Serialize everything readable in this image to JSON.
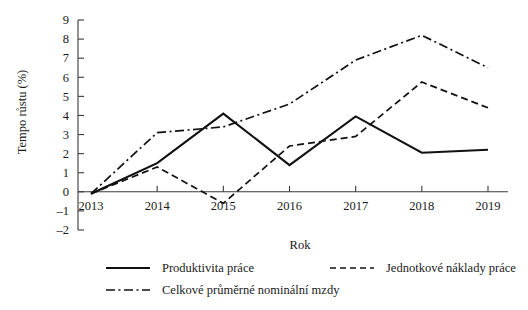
{
  "chart_data": {
    "type": "line",
    "title": "",
    "xlabel": "Rok",
    "ylabel": "Tempo růstu (%)",
    "categories": [
      "2013",
      "2014",
      "2015",
      "2016",
      "2017",
      "2018",
      "2019"
    ],
    "x": [
      2013,
      2014,
      2015,
      2016,
      2017,
      2018,
      2019
    ],
    "xlim": [
      2013,
      2019
    ],
    "ylim": [
      -2,
      9
    ],
    "yticks": [
      -2,
      -1,
      0,
      1,
      2,
      3,
      4,
      5,
      6,
      7,
      8,
      9
    ],
    "ytick_labels": [
      "-2",
      "-1",
      "0",
      "1",
      "2",
      "3",
      "4",
      "5",
      "6",
      "7",
      "8",
      "9"
    ],
    "xticks": [
      2013,
      2014,
      2015,
      2016,
      2017,
      2018,
      2019
    ],
    "grid": false,
    "legend_position": "bottom",
    "series": [
      {
        "name": "Produktivita práce",
        "style": "solid",
        "values": [
          -0.1,
          1.5,
          4.1,
          1.4,
          3.95,
          2.05,
          2.2
        ]
      },
      {
        "name": "Jednotkové náklady práce",
        "style": "dashed",
        "values": [
          -0.1,
          1.3,
          -0.6,
          2.4,
          2.9,
          5.75,
          4.4
        ]
      },
      {
        "name": "Celkové průměrné nominální mzdy",
        "style": "dashdot",
        "values": [
          -0.1,
          3.1,
          3.4,
          4.6,
          6.9,
          8.2,
          6.5
        ]
      }
    ]
  },
  "axes": {
    "y_title": "Tempo růstu (%)",
    "x_title": "Rok",
    "y_ticks": [
      "9",
      "8",
      "7",
      "6",
      "5",
      "4",
      "3",
      "2",
      "1",
      "0",
      "-1",
      "-2"
    ],
    "x_ticks": [
      "2013",
      "2014",
      "2015",
      "2016",
      "2017",
      "2018",
      "2019"
    ]
  },
  "legend": {
    "items": [
      {
        "label": "Produktivita práce",
        "style": "solid"
      },
      {
        "label": "Jednotkové náklady práce",
        "style": "dashed"
      },
      {
        "label": "Celkové průměrné nominální mzdy",
        "style": "dashdot"
      }
    ]
  },
  "colors": {
    "ink": "#111111",
    "axis": "#3a3a3a",
    "background": "#ffffff"
  }
}
